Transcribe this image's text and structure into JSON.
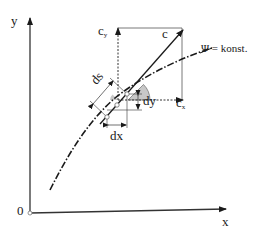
{
  "diagram": {
    "axes": {
      "x_label": "x",
      "y_label": "y",
      "origin_label": "0"
    },
    "vectors": {
      "c": "c",
      "cx": {
        "base": "c",
        "sub": "x"
      },
      "cy": {
        "base": "c",
        "sub": "y"
      }
    },
    "increments": {
      "ds": "ds",
      "dx": "dx",
      "dy": "dy"
    },
    "curve_label": "Ψ = konst.",
    "colors": {
      "line": "#1a1a1a",
      "angle_fill": "#c8c8c8",
      "guide": "#555555"
    }
  }
}
